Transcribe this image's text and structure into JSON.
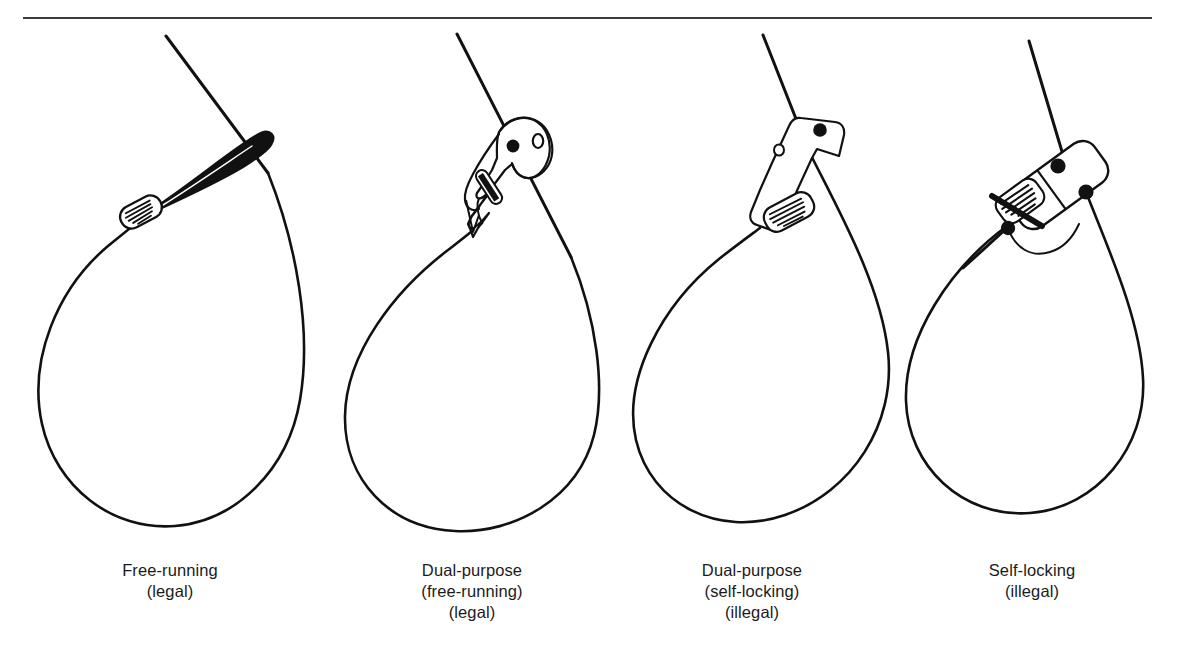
{
  "figure": {
    "name": "snare-types-comparison-diagram",
    "background_color": "#ffffff",
    "ink_color": "#111111",
    "rule": {
      "name": "top-horizontal-rule",
      "x1": 23,
      "y1": 18,
      "x2": 1152,
      "y2": 18,
      "color": "#3a3a3a",
      "thickness": 2
    }
  },
  "panels": [
    {
      "id": "free-running",
      "index": 1,
      "mechanism": "wire-eye-loop-with-crimp-ferrule",
      "parts": [
        "snare-wire-loop",
        "running-eye",
        "crimp-ferrule",
        "tail-wire"
      ],
      "caption": {
        "line1": "Free-running",
        "line2": "(legal)",
        "line3": "",
        "center_x": 170,
        "top_y": 560
      },
      "legality": "legal"
    },
    {
      "id": "dual-purpose-free-running",
      "index": 2,
      "mechanism": "hooked-metal-stop-plate-with-eyelet",
      "parts": [
        "snare-wire-loop",
        "stop-plate",
        "eyelet-hole",
        "rivet-dot",
        "crimp-ferrule",
        "tail-wire"
      ],
      "caption": {
        "line1": "Dual-purpose",
        "line2": "(free-running)",
        "line3": "(legal)",
        "center_x": 472,
        "top_y": 560
      },
      "legality": "legal"
    },
    {
      "id": "dual-purpose-self-locking",
      "index": 3,
      "mechanism": "elongated-locking-plate-with-eyelet",
      "parts": [
        "snare-wire-loop",
        "locking-plate",
        "eyelet-hole",
        "rivet-dot",
        "crimp-ferrule",
        "tail-wire"
      ],
      "caption": {
        "line1": "Dual-purpose",
        "line2": "(self-locking)",
        "line3": "(illegal)",
        "center_x": 752,
        "top_y": 560
      },
      "legality": "illegal"
    },
    {
      "id": "self-locking",
      "index": 4,
      "mechanism": "ratchet-lock-body-with-three-rivets",
      "parts": [
        "snare-wire-loop",
        "lock-body",
        "rivet-dot",
        "rivet-dot",
        "rivet-dot",
        "crimp-ferrule",
        "tail-wire"
      ],
      "caption": {
        "line1": "Self-locking",
        "line2": "(illegal)",
        "line3": "",
        "center_x": 1032,
        "top_y": 560
      },
      "legality": "illegal"
    }
  ]
}
